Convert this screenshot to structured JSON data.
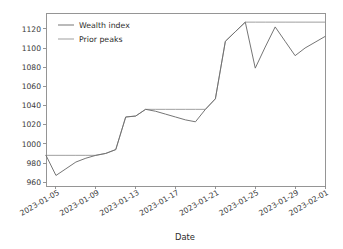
{
  "chart_data": {
    "type": "line",
    "title": "",
    "xlabel": "Date",
    "ylabel": "",
    "grid": false,
    "legend_position": "upper left",
    "ylim": [
      956,
      1136
    ],
    "yticks": [
      960,
      980,
      1000,
      1020,
      1040,
      1060,
      1080,
      1100,
      1120
    ],
    "ytick_labels": [
      "960",
      "980",
      "1000",
      "1020",
      "1040",
      "1060",
      "1080",
      "1100",
      "1120"
    ],
    "xticks": [
      "2023-01-05",
      "2023-01-09",
      "2023-01-13",
      "2023-01-17",
      "2023-01-21",
      "2023-01-25",
      "2023-01-29",
      "2023-02-01"
    ],
    "xtick_labels": [
      "2023-01-05",
      "2023-01-09",
      "2023-01-13",
      "2023-01-17",
      "2023-01-21",
      "2023-01-25",
      "2023-01-29",
      "2023-02-01"
    ],
    "xlim": [
      "2023-01-04",
      "2023-02-02"
    ],
    "x": [
      "2023-01-04",
      "2023-01-05",
      "2023-01-06",
      "2023-01-07",
      "2023-01-08",
      "2023-01-09",
      "2023-01-10",
      "2023-01-11",
      "2023-01-12",
      "2023-01-13",
      "2023-01-14",
      "2023-01-15",
      "2023-01-16",
      "2023-01-17",
      "2023-01-18",
      "2023-01-19",
      "2023-01-20",
      "2023-01-21",
      "2023-01-22",
      "2023-01-23",
      "2023-01-24",
      "2023-01-25",
      "2023-01-26",
      "2023-01-27",
      "2023-01-28",
      "2023-01-29",
      "2023-01-30",
      "2023-01-31",
      "2023-02-01"
    ],
    "series": [
      {
        "name": "Wealth index",
        "color": "#6e6e6e",
        "values": [
          988,
          967,
          974,
          981,
          985,
          988,
          990,
          994,
          1028,
          1029,
          1036,
          1034,
          1031,
          1028,
          1025,
          1023,
          1036,
          1047,
          1107,
          1117,
          1127,
          1079,
          1101,
          1122,
          1107,
          1092,
          1100,
          1106,
          1112
        ]
      },
      {
        "name": "Prior peaks",
        "color": "#9a9a9a",
        "values": [
          988,
          988,
          988,
          988,
          988,
          988,
          990,
          994,
          1028,
          1029,
          1036,
          1036,
          1036,
          1036,
          1036,
          1036,
          1036,
          1047,
          1107,
          1117,
          1127,
          1127,
          1127,
          1127,
          1127,
          1127,
          1127,
          1127,
          1127
        ]
      }
    ],
    "legend_entries": [
      "Wealth index",
      "Prior peaks"
    ]
  },
  "axes": {
    "x_axis_label": "Date"
  }
}
